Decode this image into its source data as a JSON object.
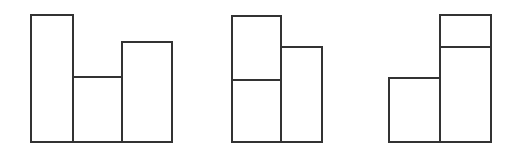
{
  "figure": {
    "title": "",
    "canvas_width": 522,
    "canvas_height": 164,
    "background_color": "#ffffff",
    "stroke_color": "#333333",
    "fill_color": "#ffffff",
    "stroke_width": 1.6,
    "baseline_y": 142
  },
  "chart_data": {
    "type": "bar",
    "title": "",
    "subtitle": "",
    "xlabel": "",
    "ylabel": "",
    "grid": false,
    "legend": false,
    "axis_visible": false,
    "baseline_y": 142,
    "xlim": [
      0,
      522
    ],
    "ylim": [
      0,
      164
    ],
    "note": "Heights are measured in pixels upward from the common baseline at y=142",
    "groups": [
      {
        "name": "group-1",
        "label": "Group 1",
        "x_start": 31,
        "x_end": 172,
        "layout": "three side-by-side columns, no internal horizontal divider",
        "bars": [
          {
            "name": "group-1-bar-1",
            "x": 31,
            "y": 15,
            "width": 42,
            "height": 127,
            "top_y": 15,
            "bottom_y": 142,
            "segments": [
              {
                "name": "group-1-bar-1-cell-1",
                "top_y": 15,
                "bottom_y": 142,
                "height": 127
              }
            ]
          },
          {
            "name": "group-1-bar-2",
            "x": 73,
            "y": 77,
            "width": 49,
            "height": 65,
            "top_y": 77,
            "bottom_y": 142,
            "segments": [
              {
                "name": "group-1-bar-2-cell-1",
                "top_y": 77,
                "bottom_y": 142,
                "height": 65
              }
            ]
          },
          {
            "name": "group-1-bar-3",
            "x": 122,
            "y": 42,
            "width": 50,
            "height": 100,
            "top_y": 42,
            "bottom_y": 142,
            "segments": [
              {
                "name": "group-1-bar-3-cell-1",
                "top_y": 42,
                "bottom_y": 142,
                "height": 100
              }
            ]
          }
        ]
      },
      {
        "name": "group-2",
        "label": "Group 2",
        "x_start": 232,
        "x_end": 322,
        "layout": "two columns; left column split into two stacked cells",
        "bars": [
          {
            "name": "group-2-bar-1",
            "x": 232,
            "y": 16,
            "width": 49,
            "height": 126,
            "top_y": 16,
            "bottom_y": 142,
            "divider_y": 80,
            "segments": [
              {
                "name": "group-2-bar-1-cell-top",
                "top_y": 16,
                "bottom_y": 80,
                "height": 64
              },
              {
                "name": "group-2-bar-1-cell-bottom",
                "top_y": 80,
                "bottom_y": 142,
                "height": 62
              }
            ]
          },
          {
            "name": "group-2-bar-2",
            "x": 281,
            "y": 47,
            "width": 41,
            "height": 95,
            "top_y": 47,
            "bottom_y": 142,
            "segments": [
              {
                "name": "group-2-bar-2-cell-1",
                "top_y": 47,
                "bottom_y": 142,
                "height": 95
              }
            ]
          }
        ]
      },
      {
        "name": "group-3",
        "label": "Group 3",
        "x_start": 389,
        "x_end": 491,
        "layout": "two columns; right column split into two stacked cells",
        "bars": [
          {
            "name": "group-3-bar-1",
            "x": 389,
            "y": 78,
            "width": 51,
            "height": 64,
            "top_y": 78,
            "bottom_y": 142,
            "segments": [
              {
                "name": "group-3-bar-1-cell-1",
                "top_y": 78,
                "bottom_y": 142,
                "height": 64
              }
            ]
          },
          {
            "name": "group-3-bar-2",
            "x": 440,
            "y": 15,
            "width": 51,
            "height": 127,
            "top_y": 15,
            "bottom_y": 142,
            "divider_y": 47,
            "segments": [
              {
                "name": "group-3-bar-2-cell-top",
                "top_y": 15,
                "bottom_y": 47,
                "height": 32
              },
              {
                "name": "group-3-bar-2-cell-bottom",
                "top_y": 47,
                "bottom_y": 142,
                "height": 95
              }
            ]
          }
        ]
      }
    ]
  }
}
